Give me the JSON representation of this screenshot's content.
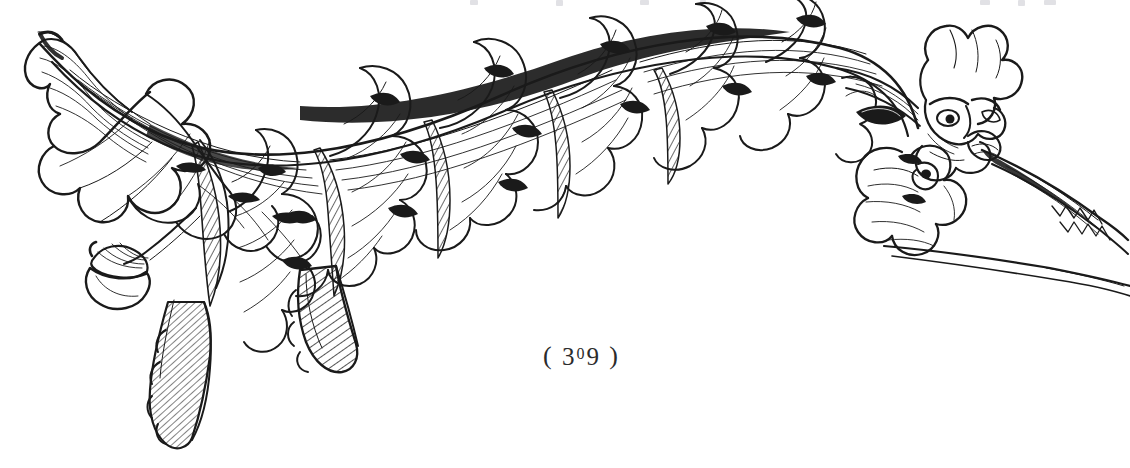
{
  "page": {
    "kind": "book-plate",
    "background_color": "#ffffff",
    "ink_color": "#1a1a1a",
    "width": 1130,
    "height": 468
  },
  "page_number": {
    "open_paren": "(",
    "digits": "309",
    "digit_three": "3",
    "digit_zero": "0",
    "digit_nine": "9",
    "close_paren": ")",
    "full_text": "( 309 )"
  },
  "illustration": {
    "title": "Acanthus leaf scroll with grotesque mask terminal",
    "technique": "line engraving",
    "ink_color": "#1a1a1a",
    "elements": [
      {
        "name": "left-leaf-tip",
        "label": "Curled acanthus tip, left terminal"
      },
      {
        "name": "main-stem",
        "label": "Sweeping arched stem"
      },
      {
        "name": "acanthus-foliage",
        "label": "Lobed acanthus leaves along stem"
      },
      {
        "name": "acorn",
        "label": "Pendant acorn on lower-left tendril"
      },
      {
        "name": "pendant-leaves",
        "label": "Two hatched leaves hanging below"
      },
      {
        "name": "grotesque-mask",
        "label": "Grotesque face terminal at right"
      },
      {
        "name": "tail-stems",
        "label": "Tapering stems at right edge"
      }
    ]
  },
  "bleed_through": {
    "label": "Faint show-through of text from preceding page",
    "color": "#c9c9cf",
    "marks": [
      {
        "left": 470,
        "width": 8,
        "height": 5
      },
      {
        "left": 556,
        "width": 7,
        "height": 6
      },
      {
        "left": 640,
        "width": 9,
        "height": 5
      },
      {
        "left": 700,
        "width": 6,
        "height": 4
      },
      {
        "left": 980,
        "width": 10,
        "height": 5
      },
      {
        "left": 1018,
        "width": 7,
        "height": 6
      },
      {
        "left": 1044,
        "width": 12,
        "height": 5
      }
    ]
  }
}
